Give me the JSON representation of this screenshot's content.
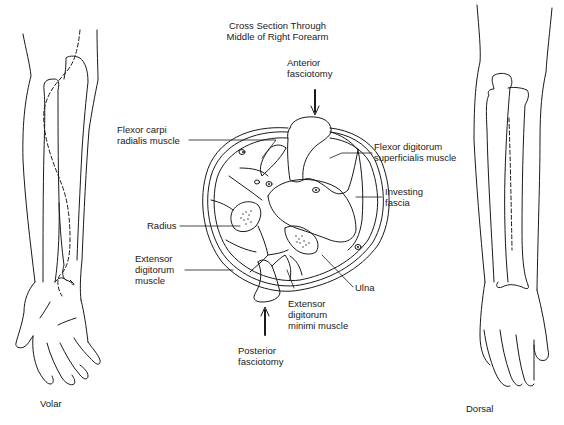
{
  "title": {
    "line1": "Cross Section Through",
    "line2": "Middle of Right Forearm"
  },
  "labels": {
    "anterior_fasciotomy": {
      "line1": "Anterior",
      "line2": "fasciotomy"
    },
    "flexor_carpi_radialis": {
      "line1": "Flexor carpi",
      "line2": "radialis muscle"
    },
    "flexor_digitorum_superficialis": {
      "line1": "Flexor digitorum",
      "line2": "superficialis muscle"
    },
    "investing_fascia": {
      "line1": "Investing",
      "line2": "fascia"
    },
    "radius": "Radius",
    "extensor_digitorum": {
      "line1": "Extensor",
      "line2": "digitorum",
      "line3": "muscle"
    },
    "ulna": "Ulna",
    "extensor_digitorum_minimi": {
      "line1": "Extensor",
      "line2": "digitorum",
      "line3": "minimi muscle"
    },
    "posterior_fasciotomy": {
      "line1": "Posterior",
      "line2": "fasciotomy"
    }
  },
  "views": {
    "left": "Volar",
    "right": "Dorsal"
  },
  "caption": "Figure 00-00. Fasciotomy of the forearm (cut off)",
  "colors": {
    "line": "#1a1a1a",
    "background": "#ffffff"
  }
}
